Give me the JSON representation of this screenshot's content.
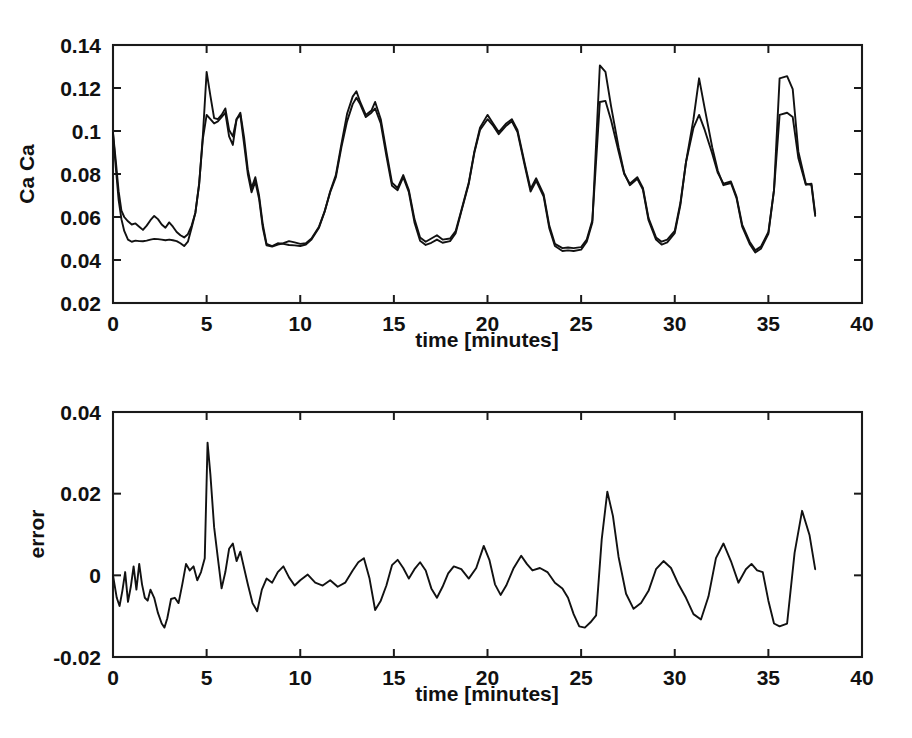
{
  "figure": {
    "background": "#ffffff",
    "line_color": "#111111",
    "panels": [
      "upper",
      "lower"
    ]
  },
  "chart_data": [
    {
      "type": "line",
      "panel": "upper",
      "title": "",
      "xlabel": "time [minutes]",
      "ylabel": "Ca Ca",
      "xlim": [
        0,
        40
      ],
      "ylim": [
        0.02,
        0.14
      ],
      "xticks": [
        0,
        5,
        10,
        15,
        20,
        25,
        30,
        35,
        40
      ],
      "xticklabels": [
        "0",
        "5",
        "10",
        "15",
        "20",
        "25",
        "30",
        "35",
        "40"
      ],
      "yticks": [
        0.02,
        0.04,
        0.06,
        0.08,
        0.1,
        0.12,
        0.14
      ],
      "yticklabels": [
        "0.02",
        "0.04",
        "0.06",
        "0.08",
        "0.1",
        "0.12",
        "0.14"
      ],
      "grid": false,
      "legend": "none",
      "series": [
        {
          "name": "measured",
          "color": "#111111",
          "x": [
            0.0,
            0.15,
            0.3,
            0.45,
            0.6,
            0.8,
            1.0,
            1.2,
            1.4,
            1.6,
            1.8,
            2.0,
            2.2,
            2.4,
            2.6,
            2.8,
            3.0,
            3.2,
            3.4,
            3.6,
            3.8,
            4.0,
            4.2,
            4.4,
            4.6,
            4.8,
            5.0,
            5.2,
            5.4,
            5.6,
            5.8,
            6.0,
            6.2,
            6.4,
            6.6,
            6.8,
            7.0,
            7.2,
            7.4,
            7.6,
            7.8,
            8.0,
            8.2,
            8.5,
            8.8,
            9.1,
            9.4,
            9.7,
            10.0,
            10.3,
            10.6,
            11.0,
            11.3,
            11.6,
            11.9,
            12.2,
            12.5,
            12.8,
            13.0,
            13.2,
            13.5,
            13.8,
            14.0,
            14.3,
            14.6,
            14.9,
            15.2,
            15.5,
            15.8,
            16.1,
            16.4,
            16.7,
            17.0,
            17.3,
            17.6,
            18.0,
            18.3,
            18.6,
            19.0,
            19.3,
            19.6,
            20.0,
            20.3,
            20.6,
            21.0,
            21.3,
            21.6,
            22.0,
            22.3,
            22.6,
            23.0,
            23.3,
            23.6,
            24.0,
            24.3,
            24.6,
            25.0,
            25.3,
            25.6,
            26.0,
            26.3,
            26.6,
            27.0,
            27.3,
            27.6,
            28.0,
            28.3,
            28.6,
            29.0,
            29.3,
            29.6,
            30.0,
            30.3,
            30.6,
            31.0,
            31.3,
            31.6,
            32.0,
            32.3,
            32.6,
            33.0,
            33.3,
            33.6,
            34.0,
            34.3,
            34.6,
            35.0,
            35.3,
            35.6,
            36.0,
            36.3,
            36.6,
            37.0,
            37.3,
            37.5
          ],
          "y": [
            0.099,
            0.086,
            0.072,
            0.063,
            0.06,
            0.058,
            0.0565,
            0.057,
            0.0555,
            0.054,
            0.056,
            0.0585,
            0.0605,
            0.059,
            0.0565,
            0.055,
            0.0575,
            0.0555,
            0.053,
            0.0515,
            0.0505,
            0.052,
            0.056,
            0.062,
            0.075,
            0.098,
            0.1275,
            0.1165,
            0.106,
            0.1055,
            0.1075,
            0.1105,
            0.1005,
            0.0975,
            0.1055,
            0.1085,
            0.097,
            0.082,
            0.0735,
            0.0785,
            0.07,
            0.0565,
            0.0475,
            0.0465,
            0.0478,
            0.0475,
            0.047,
            0.0468,
            0.0465,
            0.0472,
            0.0495,
            0.055,
            0.0625,
            0.072,
            0.0795,
            0.094,
            0.108,
            0.116,
            0.1185,
            0.1135,
            0.1075,
            0.1095,
            0.1135,
            0.1055,
            0.0905,
            0.076,
            0.0735,
            0.0795,
            0.0725,
            0.059,
            0.0505,
            0.0485,
            0.05,
            0.0515,
            0.0495,
            0.05,
            0.0535,
            0.063,
            0.076,
            0.0905,
            0.1015,
            0.1075,
            0.1035,
            0.0995,
            0.1035,
            0.1055,
            0.1005,
            0.0845,
            0.073,
            0.078,
            0.0705,
            0.056,
            0.0475,
            0.0455,
            0.0458,
            0.0455,
            0.046,
            0.0495,
            0.0585,
            0.1135,
            0.114,
            0.105,
            0.0905,
            0.08,
            0.0755,
            0.0785,
            0.0735,
            0.0595,
            0.0505,
            0.0485,
            0.0495,
            0.0535,
            0.0665,
            0.0855,
            0.1015,
            0.1075,
            0.1005,
            0.0895,
            0.0805,
            0.0755,
            0.0765,
            0.0695,
            0.0565,
            0.0485,
            0.0445,
            0.0462,
            0.053,
            0.0725,
            0.1075,
            0.1085,
            0.1065,
            0.0875,
            0.075,
            0.0755,
            0.0615,
            0.049,
            0.0488
          ]
        },
        {
          "name": "model",
          "color": "#111111",
          "x": [
            0.0,
            0.15,
            0.3,
            0.45,
            0.6,
            0.8,
            1.0,
            1.2,
            1.4,
            1.6,
            1.8,
            2.0,
            2.2,
            2.4,
            2.6,
            2.8,
            3.0,
            3.2,
            3.4,
            3.6,
            3.8,
            4.0,
            4.2,
            4.4,
            4.6,
            4.8,
            5.0,
            5.2,
            5.4,
            5.6,
            5.8,
            6.0,
            6.2,
            6.4,
            6.6,
            6.8,
            7.0,
            7.2,
            7.4,
            7.6,
            7.8,
            8.0,
            8.2,
            8.5,
            8.8,
            9.1,
            9.4,
            9.7,
            10.0,
            10.3,
            10.6,
            11.0,
            11.3,
            11.6,
            11.9,
            12.2,
            12.5,
            12.8,
            13.0,
            13.2,
            13.5,
            13.8,
            14.0,
            14.3,
            14.6,
            14.9,
            15.2,
            15.5,
            15.8,
            16.1,
            16.4,
            16.7,
            17.0,
            17.3,
            17.6,
            18.0,
            18.3,
            18.6,
            19.0,
            19.3,
            19.6,
            20.0,
            20.3,
            20.6,
            21.0,
            21.3,
            21.6,
            22.0,
            22.3,
            22.6,
            23.0,
            23.3,
            23.6,
            24.0,
            24.3,
            24.6,
            25.0,
            25.3,
            25.6,
            26.0,
            26.3,
            26.6,
            27.0,
            27.3,
            27.6,
            28.0,
            28.3,
            28.6,
            29.0,
            29.3,
            29.6,
            30.0,
            30.3,
            30.6,
            31.0,
            31.3,
            31.6,
            32.0,
            32.3,
            32.6,
            33.0,
            33.3,
            33.6,
            34.0,
            34.3,
            34.6,
            35.0,
            35.3,
            35.6,
            36.0,
            36.3,
            36.6,
            37.0,
            37.3,
            37.5
          ],
          "y": [
            0.099,
            0.083,
            0.068,
            0.059,
            0.0535,
            0.0495,
            0.0485,
            0.049,
            0.0488,
            0.0487,
            0.049,
            0.0495,
            0.0498,
            0.0497,
            0.0495,
            0.0492,
            0.0495,
            0.0492,
            0.0488,
            0.0478,
            0.0465,
            0.0485,
            0.055,
            0.062,
            0.0755,
            0.0965,
            0.1075,
            0.1055,
            0.1035,
            0.1045,
            0.1065,
            0.1085,
            0.0975,
            0.0935,
            0.1055,
            0.1075,
            0.094,
            0.08,
            0.0715,
            0.0765,
            0.0685,
            0.055,
            0.0468,
            0.0462,
            0.0472,
            0.0478,
            0.0488,
            0.0482,
            0.0475,
            0.0478,
            0.05,
            0.0555,
            0.0625,
            0.0715,
            0.0785,
            0.0925,
            0.1045,
            0.1125,
            0.1155,
            0.1125,
            0.1065,
            0.1085,
            0.1105,
            0.1035,
            0.0885,
            0.0745,
            0.0725,
            0.0785,
            0.0715,
            0.0575,
            0.049,
            0.047,
            0.048,
            0.0495,
            0.048,
            0.0488,
            0.0525,
            0.0625,
            0.0755,
            0.09,
            0.1005,
            0.1055,
            0.1025,
            0.0985,
            0.1025,
            0.1045,
            0.0995,
            0.0835,
            0.0718,
            0.0768,
            0.0695,
            0.0548,
            0.0465,
            0.0442,
            0.0445,
            0.0442,
            0.0448,
            0.0485,
            0.0575,
            0.1305,
            0.1275,
            0.1115,
            0.0925,
            0.0805,
            0.0748,
            0.0778,
            0.0728,
            0.0585,
            0.0495,
            0.0472,
            0.0482,
            0.0525,
            0.0655,
            0.0855,
            0.1055,
            0.1245,
            0.1105,
            0.0925,
            0.0815,
            0.0748,
            0.0758,
            0.0688,
            0.0555,
            0.0475,
            0.0435,
            0.0452,
            0.0522,
            0.0725,
            0.1245,
            0.1255,
            0.1195,
            0.0905,
            0.0755,
            0.0748,
            0.0605,
            0.048,
            0.0478
          ]
        }
      ]
    },
    {
      "type": "line",
      "panel": "lower",
      "title": "",
      "xlabel": "time [minutes]",
      "ylabel": "error",
      "xlim": [
        0,
        40
      ],
      "ylim": [
        -0.02,
        0.04
      ],
      "xticks": [
        0,
        5,
        10,
        15,
        20,
        25,
        30,
        35,
        40
      ],
      "xticklabels": [
        "0",
        "5",
        "10",
        "15",
        "20",
        "25",
        "30",
        "35",
        "40"
      ],
      "yticks": [
        -0.02,
        0,
        0.02,
        0.04
      ],
      "yticklabels": [
        "-0.02",
        "0",
        "0.02",
        "0.04"
      ],
      "grid": false,
      "legend": "none",
      "series": [
        {
          "name": "error",
          "color": "#111111",
          "x": [
            0.0,
            0.2,
            0.35,
            0.5,
            0.65,
            0.8,
            0.95,
            1.1,
            1.25,
            1.4,
            1.55,
            1.7,
            1.85,
            2.0,
            2.2,
            2.4,
            2.6,
            2.75,
            2.9,
            3.1,
            3.3,
            3.5,
            3.7,
            3.9,
            4.1,
            4.3,
            4.5,
            4.7,
            4.9,
            5.05,
            5.2,
            5.4,
            5.6,
            5.8,
            6.0,
            6.2,
            6.4,
            6.6,
            6.8,
            7.0,
            7.2,
            7.45,
            7.7,
            7.95,
            8.2,
            8.5,
            8.8,
            9.1,
            9.4,
            9.7,
            10.0,
            10.4,
            10.8,
            11.2,
            11.6,
            12.0,
            12.4,
            12.8,
            13.1,
            13.4,
            13.7,
            14.0,
            14.3,
            14.6,
            14.9,
            15.2,
            15.5,
            15.8,
            16.1,
            16.4,
            16.7,
            17.0,
            17.3,
            17.6,
            17.9,
            18.2,
            18.6,
            19.0,
            19.4,
            19.8,
            20.1,
            20.4,
            20.7,
            21.0,
            21.4,
            21.8,
            22.1,
            22.4,
            22.8,
            23.2,
            23.6,
            24.0,
            24.3,
            24.6,
            24.9,
            25.2,
            25.5,
            25.8,
            26.1,
            26.4,
            26.7,
            27.0,
            27.4,
            27.8,
            28.2,
            28.6,
            29.0,
            29.4,
            29.8,
            30.2,
            30.6,
            31.0,
            31.4,
            31.8,
            32.2,
            32.6,
            33.0,
            33.4,
            33.8,
            34.1,
            34.4,
            34.7,
            35.0,
            35.3,
            35.6,
            36.0,
            36.4,
            36.8,
            37.2,
            37.5
          ],
          "y": [
            0.0,
            -0.0055,
            -0.0075,
            -0.0038,
            0.0008,
            -0.0065,
            -0.0028,
            0.0022,
            -0.0035,
            0.0028,
            -0.0022,
            -0.0055,
            -0.0062,
            -0.0035,
            -0.0055,
            -0.0092,
            -0.0118,
            -0.0128,
            -0.0105,
            -0.0058,
            -0.0055,
            -0.0068,
            -0.0022,
            0.0028,
            0.0012,
            0.0022,
            -0.0012,
            0.0008,
            0.0042,
            0.0325,
            0.0248,
            0.0118,
            0.0042,
            -0.0032,
            0.0008,
            0.0065,
            0.0078,
            0.0035,
            0.0058,
            0.0018,
            -0.0022,
            -0.0068,
            -0.0088,
            -0.0035,
            -0.0008,
            -0.0018,
            0.0008,
            0.0022,
            -0.0005,
            -0.0025,
            -0.0012,
            0.0002,
            -0.0018,
            -0.0025,
            -0.0012,
            -0.0028,
            -0.0018,
            0.0012,
            0.0032,
            0.0042,
            -0.0008,
            -0.0085,
            -0.0062,
            -0.0025,
            0.0025,
            0.0038,
            0.0018,
            -0.0008,
            0.0015,
            0.0032,
            0.0012,
            -0.0032,
            -0.0055,
            -0.0028,
            0.0005,
            0.0022,
            0.0015,
            -0.0008,
            0.0018,
            0.0072,
            0.0038,
            -0.0022,
            -0.0048,
            -0.0025,
            0.0018,
            0.0048,
            0.0028,
            0.0012,
            0.0018,
            0.0008,
            -0.0018,
            -0.0032,
            -0.0055,
            -0.0095,
            -0.0125,
            -0.0128,
            -0.0115,
            -0.0098,
            0.0088,
            0.0205,
            0.0145,
            0.0045,
            -0.0045,
            -0.0082,
            -0.0068,
            -0.0038,
            0.0015,
            0.0035,
            0.0018,
            -0.0022,
            -0.0055,
            -0.0095,
            -0.0108,
            -0.0052,
            0.0042,
            0.0078,
            0.0035,
            -0.0018,
            0.0015,
            0.0028,
            0.0012,
            0.0008,
            -0.0062,
            -0.0118,
            -0.0125,
            -0.0118,
            0.0055,
            0.0158,
            0.0098,
            0.0015,
            -0.0048,
            -0.0015,
            0.0042,
            0.0048,
            0.0005
          ]
        }
      ]
    }
  ]
}
